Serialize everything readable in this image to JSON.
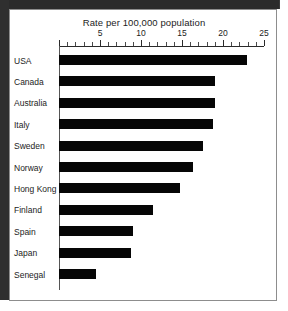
{
  "chart_data": {
    "type": "bar",
    "orientation": "horizontal",
    "title": "Rate per 100,000 population",
    "xlabel": "",
    "ylabel": "",
    "xlim": [
      0,
      25
    ],
    "xticks": [
      0,
      5,
      10,
      15,
      20,
      25
    ],
    "xtick_labels": [
      "",
      "5",
      "10",
      "15",
      "20",
      "25"
    ],
    "minor_tick_step": 1,
    "grid": false,
    "legend": null,
    "bar_color": "#060606",
    "categories": [
      "USA",
      "Canada",
      "Australia",
      "Italy",
      "Sweden",
      "Norway",
      "Hong Kong",
      "Finland",
      "Spain",
      "Japan",
      "Senegal"
    ],
    "values": [
      22.9,
      19.0,
      19.0,
      18.8,
      17.5,
      16.4,
      14.7,
      11.5,
      9.0,
      8.8,
      4.5
    ]
  }
}
